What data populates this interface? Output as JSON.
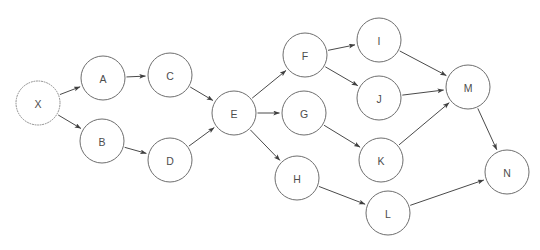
{
  "diagram": {
    "caption": "",
    "background_color": "#ffffff",
    "node_stroke_color": "#6e6e6e",
    "node_fill_color": "#ffffff",
    "edge_color": "#4a4a4a",
    "label_color": "#4d4d4d",
    "node_radius": 22,
    "nodes": [
      {
        "id": "X",
        "label": "X",
        "cx": 38,
        "cy": 103,
        "style": "dotted"
      },
      {
        "id": "A",
        "label": "A",
        "cx": 103,
        "cy": 78,
        "style": "solid"
      },
      {
        "id": "B",
        "label": "B",
        "cx": 102,
        "cy": 141,
        "style": "solid"
      },
      {
        "id": "C",
        "label": "C",
        "cx": 170,
        "cy": 75,
        "style": "solid"
      },
      {
        "id": "D",
        "label": "D",
        "cx": 170,
        "cy": 160,
        "style": "solid"
      },
      {
        "id": "E",
        "label": "E",
        "cx": 234,
        "cy": 113,
        "style": "solid"
      },
      {
        "id": "F",
        "label": "F",
        "cx": 305,
        "cy": 55,
        "style": "solid"
      },
      {
        "id": "G",
        "label": "G",
        "cx": 304,
        "cy": 113,
        "style": "solid"
      },
      {
        "id": "H",
        "label": "H",
        "cx": 297,
        "cy": 178,
        "style": "solid"
      },
      {
        "id": "I",
        "label": "I",
        "cx": 379,
        "cy": 40,
        "style": "solid"
      },
      {
        "id": "J",
        "label": "J",
        "cx": 379,
        "cy": 98,
        "style": "solid"
      },
      {
        "id": "K",
        "label": "K",
        "cx": 381,
        "cy": 160,
        "style": "solid"
      },
      {
        "id": "L",
        "label": "L",
        "cx": 388,
        "cy": 213,
        "style": "solid"
      },
      {
        "id": "M",
        "label": "M",
        "cx": 468,
        "cy": 87,
        "style": "solid"
      },
      {
        "id": "N",
        "label": "N",
        "cx": 507,
        "cy": 172,
        "style": "solid"
      }
    ],
    "edges": [
      {
        "from": "X",
        "to": "A"
      },
      {
        "from": "X",
        "to": "B"
      },
      {
        "from": "A",
        "to": "C"
      },
      {
        "from": "B",
        "to": "D"
      },
      {
        "from": "C",
        "to": "E"
      },
      {
        "from": "D",
        "to": "E"
      },
      {
        "from": "E",
        "to": "F"
      },
      {
        "from": "E",
        "to": "G"
      },
      {
        "from": "E",
        "to": "H"
      },
      {
        "from": "F",
        "to": "I"
      },
      {
        "from": "F",
        "to": "J"
      },
      {
        "from": "G",
        "to": "K"
      },
      {
        "from": "H",
        "to": "L"
      },
      {
        "from": "I",
        "to": "M"
      },
      {
        "from": "J",
        "to": "M"
      },
      {
        "from": "K",
        "to": "M"
      },
      {
        "from": "M",
        "to": "N"
      },
      {
        "from": "L",
        "to": "N"
      }
    ]
  }
}
